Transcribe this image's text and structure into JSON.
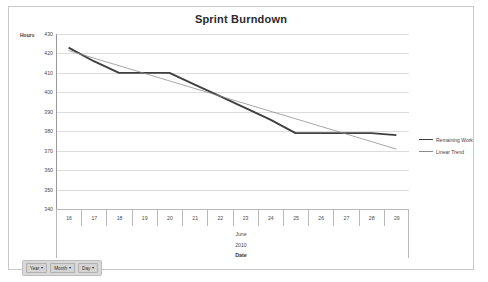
{
  "chart_data": {
    "type": "line",
    "title": "Sprint Burndown",
    "xlabel": "Date",
    "ylabel": "Hours",
    "ylim": [
      340,
      430
    ],
    "ytick_step": 10,
    "yticks": [
      430,
      420,
      410,
      400,
      390,
      380,
      370,
      360,
      350,
      340
    ],
    "grid": true,
    "legend_position": "right",
    "categories": [
      "16",
      "17",
      "18",
      "19",
      "20",
      "21",
      "22",
      "23",
      "24",
      "25",
      "26",
      "27",
      "28",
      "29"
    ],
    "axis_group_labels": [
      "June",
      "2010"
    ],
    "series": [
      {
        "name": "Remaining Work",
        "style": "thick",
        "color": "#3f3f3f",
        "values": [
          423,
          416,
          410,
          410,
          410,
          404,
          398,
          392,
          386,
          379,
          379,
          379,
          379,
          378
        ]
      },
      {
        "name": "Linear Trend",
        "style": "thin",
        "color": "#8a8a8a",
        "values": [
          421.5,
          417.6,
          413.7,
          409.8,
          405.9,
          402.0,
          398.1,
          394.2,
          390.3,
          386.4,
          382.5,
          378.6,
          374.7,
          370.8
        ]
      }
    ]
  },
  "field_buttons": [
    {
      "label": "Year",
      "caret": "▾"
    },
    {
      "label": "Month",
      "caret": "▾"
    },
    {
      "label": "Day",
      "caret": "▾"
    }
  ]
}
